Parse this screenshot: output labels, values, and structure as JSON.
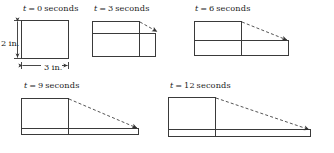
{
  "figure": {
    "background_color": "#ffffff",
    "stroke_color": "#3a3a3a",
    "dash_color": "#555555",
    "text_color": "#1a1a1a"
  },
  "dimensions": {
    "height_label": "2 in.",
    "width_label": "3 in."
  },
  "panels": [
    {
      "id": "t0",
      "label": "t = 0 seconds",
      "time_value": 0,
      "time_unit": "seconds",
      "shape": "rectangle",
      "has_dimension_labels": true,
      "has_dashed_arrow": false,
      "body_height_px": 38,
      "body_width_px": 47,
      "slab_height_px": 0
    },
    {
      "id": "t3",
      "label": "t = 3 seconds",
      "time_value": 3,
      "time_unit": "seconds",
      "shape": "spread-rectangle",
      "has_dimension_labels": false,
      "has_dashed_arrow": true,
      "body_height_px": 13,
      "body_width_px": 47,
      "slab_height_px": 22,
      "slab_width_px": 63
    },
    {
      "id": "t6",
      "label": "t = 6 seconds",
      "time_value": 6,
      "time_unit": "seconds",
      "shape": "spread-rectangle",
      "has_dimension_labels": false,
      "has_dashed_arrow": true,
      "body_height_px": 20,
      "body_width_px": 47,
      "slab_height_px": 14,
      "slab_width_px": 94
    },
    {
      "id": "t9",
      "label": "t = 9 seconds",
      "time_value": 9,
      "time_unit": "seconds",
      "shape": "spread-rectangle",
      "has_dimension_labels": false,
      "has_dashed_arrow": true,
      "body_height_px": 30,
      "body_width_px": 47,
      "slab_height_px": 5,
      "slab_width_px": 117
    },
    {
      "id": "t12",
      "label": "t = 12 seconds",
      "time_value": 12,
      "time_unit": "seconds",
      "shape": "spread-rectangle",
      "has_dimension_labels": false,
      "has_dashed_arrow": true,
      "body_height_px": 32,
      "body_width_px": 47,
      "slab_height_px": 6,
      "slab_width_px": 142
    }
  ]
}
